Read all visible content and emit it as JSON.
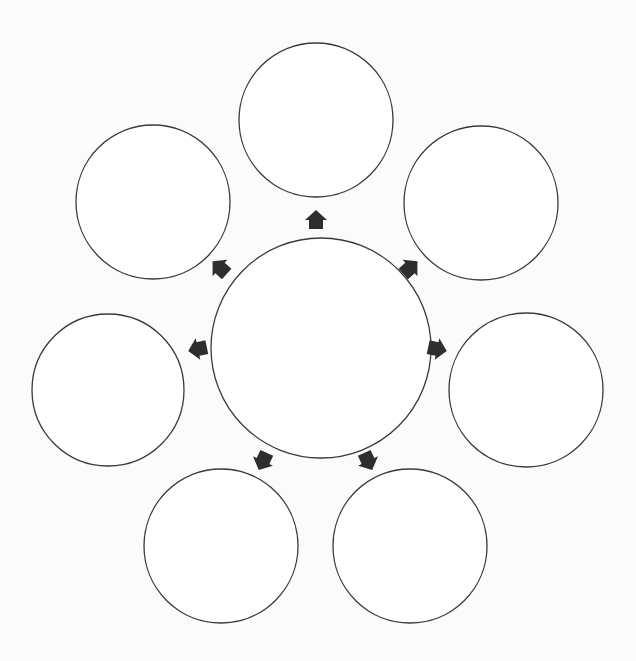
{
  "diagram": {
    "type": "hub-and-spoke",
    "background": "#fbfbfb",
    "stroke_color": "#3a3a3a",
    "arrow_color": "#2e2e2e",
    "center": {
      "id": "center",
      "cx": 321,
      "cy": 348,
      "r": 110,
      "label": ""
    },
    "nodes": [
      {
        "id": "top",
        "cx": 316,
        "cy": 120,
        "r": 77,
        "label": ""
      },
      {
        "id": "top-right",
        "cx": 481,
        "cy": 203,
        "r": 77,
        "label": ""
      },
      {
        "id": "right",
        "cx": 526,
        "cy": 390,
        "r": 77,
        "label": ""
      },
      {
        "id": "bottom-right",
        "cx": 410,
        "cy": 546,
        "r": 77,
        "label": ""
      },
      {
        "id": "bottom-left",
        "cx": 221,
        "cy": 546,
        "r": 77,
        "label": ""
      },
      {
        "id": "left",
        "cx": 108,
        "cy": 390,
        "r": 76,
        "label": ""
      },
      {
        "id": "top-left",
        "cx": 153,
        "cy": 202,
        "r": 77,
        "label": ""
      }
    ],
    "arrows": [
      {
        "id": "to-top",
        "x": 316,
        "y": 220,
        "angle": 0
      },
      {
        "id": "to-top-right",
        "x": 410,
        "y": 268,
        "angle": 48
      },
      {
        "id": "to-right",
        "x": 437,
        "y": 349,
        "angle": 102
      },
      {
        "id": "to-bottom-right",
        "x": 368,
        "y": 461,
        "angle": 155
      },
      {
        "id": "to-bottom-left",
        "x": 263,
        "y": 461,
        "angle": -155
      },
      {
        "id": "to-left",
        "x": 198,
        "y": 349,
        "angle": -102
      },
      {
        "id": "to-top-left",
        "x": 220,
        "y": 268,
        "angle": -48
      }
    ]
  }
}
